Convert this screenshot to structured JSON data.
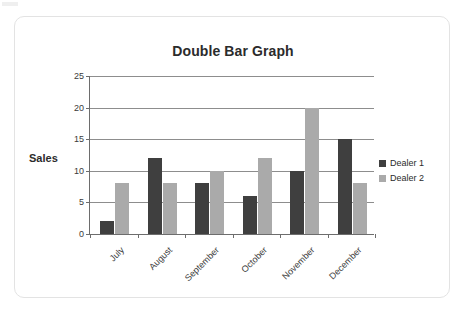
{
  "card": {
    "accent_dark": "#3f3f3f",
    "accent_light": "#aaaaaa"
  },
  "axis_label": {
    "y": "Sales"
  },
  "chart_data": {
    "type": "bar",
    "title": "Double Bar Graph",
    "xlabel": "",
    "ylabel": "Sales",
    "categories": [
      "July",
      "August",
      "September",
      "October",
      "November",
      "December"
    ],
    "series": [
      {
        "name": "Dealer 1",
        "color": "#3f3f3f",
        "values": [
          2,
          12,
          8,
          6,
          10,
          15
        ]
      },
      {
        "name": "Dealer 2",
        "color": "#aaaaaa",
        "values": [
          8,
          8,
          10,
          12,
          20,
          8
        ]
      }
    ],
    "ylim": [
      0,
      25
    ],
    "yticks": [
      0,
      5,
      10,
      15,
      20,
      25
    ],
    "ytick_labels": [
      "0",
      "5",
      "10",
      "15",
      "20",
      "25"
    ],
    "grid": true,
    "legend_position": "right"
  }
}
